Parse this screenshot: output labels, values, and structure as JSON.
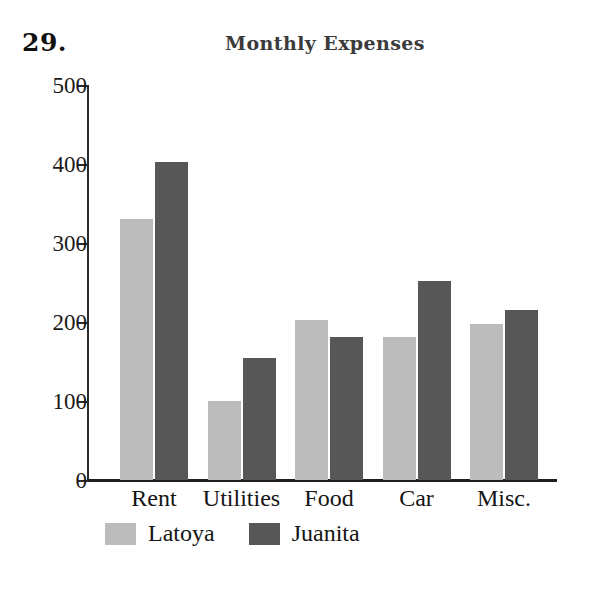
{
  "problem_number": "29.",
  "chart_data": {
    "type": "bar",
    "title": "Monthly Expenses",
    "xlabel": "",
    "ylabel": "",
    "ylim": [
      0,
      500
    ],
    "ytick_values": [
      500,
      400,
      300,
      200,
      100,
      0
    ],
    "ytick_labels": [
      "500",
      "400",
      "300",
      "200",
      "100",
      "0"
    ],
    "grid": false,
    "legend_position": "bottom-left",
    "categories": [
      "Rent",
      "Utilities",
      "Food",
      "Car",
      "Misc."
    ],
    "series": [
      {
        "name": "Latoya",
        "color": "#bcbcbc",
        "values": [
          330,
          100,
          202,
          181,
          198
        ]
      },
      {
        "name": "Juanita",
        "color": "#575757",
        "values": [
          403,
          154,
          181,
          252,
          215
        ]
      }
    ]
  }
}
